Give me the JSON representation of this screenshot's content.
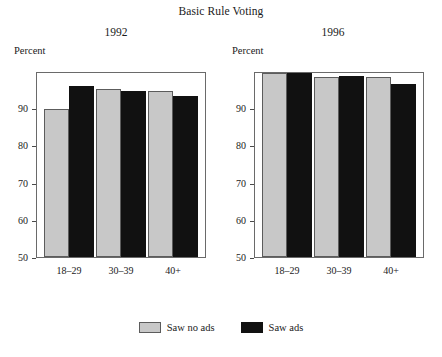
{
  "chart_data": {
    "type": "bar",
    "title": "Basic Rule Voting",
    "xlabel": "",
    "ylabel": "Percent",
    "ylim": [
      50,
      100
    ],
    "yticks": [
      50,
      60,
      70,
      80,
      90
    ],
    "grid": false,
    "legend_position": "bottom-center",
    "categories": [
      "18–29",
      "30–39",
      "40+"
    ],
    "panels": [
      {
        "name": "1992",
        "unit_label": "Percent",
        "series": [
          {
            "name": "Saw no ads",
            "color": "#c8c8c8",
            "values": [
              89.8,
              95.2,
              94.7
            ]
          },
          {
            "name": "Saw ads",
            "color": "#111111",
            "values": [
              96.0,
              94.5,
              93.2
            ]
          }
        ]
      },
      {
        "name": "1996",
        "unit_label": "Percent",
        "series": [
          {
            "name": "Saw no ads",
            "color": "#c8c8c8",
            "values": [
              99.5,
              98.3,
              98.3
            ]
          },
          {
            "name": "Saw ads",
            "color": "#111111",
            "values": [
              99.5,
              98.7,
              96.5
            ]
          }
        ]
      }
    ],
    "legend": [
      {
        "label": "Saw no ads",
        "color": "#c8c8c8"
      },
      {
        "label": "Saw ads",
        "color": "#111111"
      }
    ]
  }
}
